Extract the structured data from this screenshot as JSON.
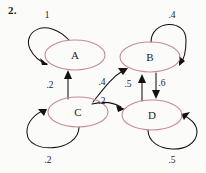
{
  "problem": {
    "number": "2."
  },
  "diagram": {
    "type": "markov-chain-state-diagram",
    "node_stroke_color": "#c9899b",
    "edge_color": "#14110f",
    "background_color": "#fbfbfa",
    "states": [
      {
        "id": "A",
        "label": "A",
        "cx": 75,
        "cy": 55,
        "rx": 30,
        "ry": 15
      },
      {
        "id": "B",
        "label": "B",
        "cx": 150,
        "cy": 57,
        "rx": 30,
        "ry": 15
      },
      {
        "id": "C",
        "label": "C",
        "cx": 78,
        "cy": 112,
        "rx": 30,
        "ry": 15
      },
      {
        "id": "D",
        "label": "D",
        "cx": 152,
        "cy": 115,
        "rx": 30,
        "ry": 15
      }
    ],
    "transitions": [
      {
        "from": "A",
        "to": "A",
        "label": "1",
        "label_x": 47,
        "label_y": 16,
        "kind": "self-loop"
      },
      {
        "from": "B",
        "to": "B",
        "label": ".4",
        "label_x": 172,
        "label_y": 16,
        "kind": "self-loop"
      },
      {
        "from": "C",
        "to": "C",
        "label": ".2",
        "label_x": 48,
        "label_y": 161,
        "kind": "self-loop"
      },
      {
        "from": "D",
        "to": "D",
        "label": ".5",
        "label_x": 172,
        "label_y": 161,
        "kind": "self-loop"
      },
      {
        "from": "C",
        "to": "A",
        "label": ".2",
        "label_x": 50,
        "label_y": 86,
        "kind": "straight"
      },
      {
        "from": "C",
        "to": "B",
        "label": ".4",
        "label_x": 102,
        "label_y": 83,
        "kind": "curve"
      },
      {
        "from": "C",
        "to": "D",
        "label": ".2",
        "label_x": 102,
        "label_y": 102,
        "kind": "curve"
      },
      {
        "from": "D",
        "to": "B",
        "label": ".5",
        "label_x": 128,
        "label_y": 85,
        "kind": "straight"
      },
      {
        "from": "B",
        "to": "D",
        "label": ".6",
        "label_x": 162,
        "label_y": 84,
        "kind": "straight"
      }
    ]
  }
}
